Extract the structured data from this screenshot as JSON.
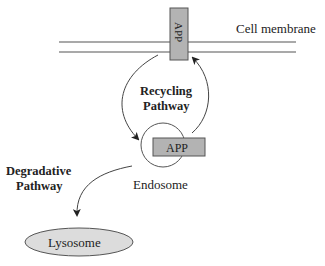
{
  "diagram": {
    "membrane_label": "Cell membrane",
    "app_membrane_label": "APP",
    "app_endosome_label": "APP",
    "recycling_line1": "Recycling",
    "recycling_line2": "Pathway",
    "degradative_line1": "Degradative",
    "degradative_line2": "Pathway",
    "endosome_label": "Endosome",
    "lysosome_label": "Lysosome"
  },
  "colors": {
    "protein_fill": "#b3b3b3",
    "lysosome_fill": "#dcdcdc",
    "stroke": "#444444"
  }
}
